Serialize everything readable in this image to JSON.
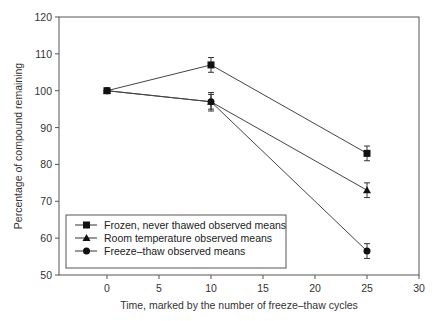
{
  "chart_data": {
    "type": "line",
    "title": "",
    "xlabel": "Time, marked by the number of freeze–thaw cycles",
    "ylabel": "Percentage of compound remaining",
    "xlim": [
      -5,
      30
    ],
    "ylim": [
      50,
      120
    ],
    "x_ticks": [
      0,
      5,
      10,
      15,
      20,
      25,
      30
    ],
    "y_ticks": [
      50,
      60,
      70,
      80,
      90,
      100,
      110,
      120
    ],
    "grid": false,
    "legend_position": "lower left, inside",
    "x": [
      0,
      10,
      25
    ],
    "series": [
      {
        "name": "Frozen, never thawed observed means",
        "marker": "square",
        "values": [
          100,
          107,
          83
        ],
        "error": [
          0,
          2,
          2
        ]
      },
      {
        "name": "Room temperature observed means",
        "marker": "triangle",
        "values": [
          100,
          97,
          73
        ],
        "error": [
          0,
          2,
          2
        ]
      },
      {
        "name": "Freeze–thaw observed means",
        "marker": "circle",
        "values": [
          100,
          97,
          56.5
        ],
        "error": [
          0,
          2.5,
          2
        ]
      }
    ]
  },
  "legend": {
    "items": [
      {
        "label": "Frozen, never thawed observed means"
      },
      {
        "label": "Room temperature observed means"
      },
      {
        "label": "Freeze–thaw observed means"
      }
    ]
  }
}
